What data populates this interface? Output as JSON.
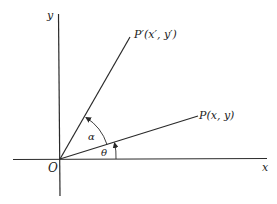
{
  "diagram": {
    "type": "rotation-of-point-about-origin",
    "colors": {
      "background": "#ffffff",
      "ink": "#2a2a2a"
    },
    "axes": {
      "x_label": "x",
      "y_label": "y",
      "origin_label": "O"
    },
    "points": {
      "original": {
        "label": "P(x, y)",
        "name": "P"
      },
      "rotated": {
        "label": "P′(x′, y′)",
        "name": "P′"
      }
    },
    "angles": {
      "theta": {
        "label": "θ",
        "description": "angle between x-axis and OP"
      },
      "alpha": {
        "label": "α",
        "description": "rotation angle from OP to OP′"
      }
    }
  }
}
